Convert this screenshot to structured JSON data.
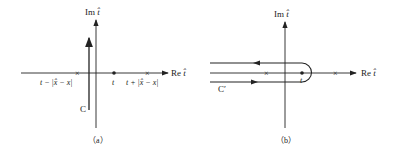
{
  "panels": [
    {
      "id": "a",
      "caption": "（a）",
      "axes": {
        "x_label_prefix": "Re",
        "y_label_prefix": "Im",
        "var": "t̂"
      },
      "contour_label": "C",
      "points": [
        {
          "kind": "pole",
          "label": "t − |x̂ − x|"
        },
        {
          "kind": "point",
          "label": "t"
        },
        {
          "kind": "pole",
          "label": "t + |x̂ − x|"
        }
      ]
    },
    {
      "id": "b",
      "caption": "（b）",
      "axes": {
        "x_label_prefix": "Re",
        "y_label_prefix": "Im",
        "var": "t̂"
      },
      "contour_label": "C′",
      "points": [
        {
          "kind": "pole",
          "label": ""
        },
        {
          "kind": "point",
          "label": "t"
        },
        {
          "kind": "pole",
          "label": ""
        }
      ]
    }
  ],
  "colors": {
    "ink": "#222222",
    "background": "#ffffff"
  }
}
